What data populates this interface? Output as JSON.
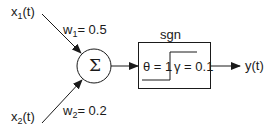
{
  "inputs": [
    {
      "var": "x",
      "sub": "1",
      "suffix": "(t)",
      "weight_label": "w",
      "weight_sub": "1",
      "weight_value": "= 0.5"
    },
    {
      "var": "x",
      "sub": "2",
      "suffix": "(t)",
      "weight_label": "w",
      "weight_sub": "2",
      "weight_value": "= 0.2"
    }
  ],
  "summation": {
    "symbol": "Σ"
  },
  "activation": {
    "title": "sgn",
    "theta_label": "θ = 1",
    "gamma_label": "γ = 0.1"
  },
  "output": {
    "label": "y(t)"
  },
  "colors": {
    "stroke": "#1a1a1a",
    "background": "#ffffff"
  }
}
